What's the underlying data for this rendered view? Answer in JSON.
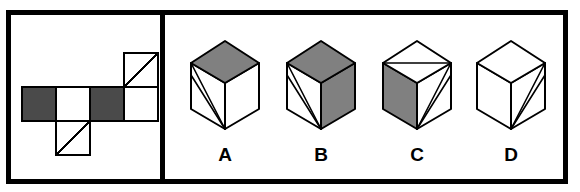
{
  "figure": {
    "type": "spatial-reasoning-cube-folding-puzzle",
    "panels": {
      "left_label": "unfolded-cube-net",
      "right_label": "cube-answer-options"
    }
  },
  "colors": {
    "outline": "#000000",
    "paper": "#ffffff",
    "net_shaded": "#4a4a4a",
    "cube_shaded": "#808080",
    "cube_face_white": "#ffffff"
  },
  "net": {
    "description": "Six-square cross-like net of a cube",
    "cell_size": 34,
    "squares": [
      {
        "id": "net-square-left-shaded",
        "row": 1,
        "col": 0,
        "fill": "shaded",
        "diagonal": "none"
      },
      {
        "id": "net-square-middle-white",
        "row": 1,
        "col": 1,
        "fill": "white",
        "diagonal": "none"
      },
      {
        "id": "net-square-center-shaded",
        "row": 1,
        "col": 2,
        "fill": "shaded",
        "diagonal": "none"
      },
      {
        "id": "net-square-right-white",
        "row": 1,
        "col": 3,
        "fill": "white",
        "diagonal": "none"
      },
      {
        "id": "net-square-top-right-white",
        "row": 0,
        "col": 3,
        "fill": "white",
        "diagonal": "bottom-left-to-top-right"
      },
      {
        "id": "net-square-bottom-white",
        "row": 2,
        "col": 1,
        "fill": "white",
        "diagonal": "bottom-left-to-top-right"
      }
    ]
  },
  "options": [
    {
      "label": "A",
      "name": "option-a",
      "top_face": "shaded",
      "left_face": "white",
      "right_face": "white",
      "diagonals": "two lines on left face from top-left vertex to bottom vertex"
    },
    {
      "label": "B",
      "name": "option-b",
      "top_face": "shaded",
      "left_face": "white",
      "right_face": "shaded",
      "diagonals": "two lines on left face from top-left vertex to bottom vertex"
    },
    {
      "label": "C",
      "name": "option-c",
      "top_face": "white",
      "left_face": "shaded",
      "right_face": "white",
      "diagonals": "horizontal chord across top face; two lines on right face from right vertex to bottom vertex"
    },
    {
      "label": "D",
      "name": "option-d",
      "top_face": "white",
      "left_face": "white",
      "right_face": "white",
      "diagonals": "two lines on right face from right vertex to bottom vertex"
    }
  ]
}
